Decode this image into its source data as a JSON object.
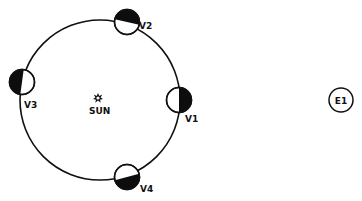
{
  "diagram": {
    "colors": {
      "line": "#111111",
      "dark": "#0d0d0d",
      "background": "#ffffff"
    },
    "orbit": {
      "cx": 100,
      "cy": 100,
      "r": 80
    },
    "sun": {
      "label": "SUN",
      "icon": "sun-icon",
      "x": 98,
      "y": 99
    },
    "planets": [
      {
        "id": "V1",
        "label": "V1",
        "x": 179,
        "y": 100,
        "dark_side": "right"
      },
      {
        "id": "V2",
        "label": "V2",
        "x": 127,
        "y": 22,
        "dark_side": "top"
      },
      {
        "id": "V3",
        "label": "V3",
        "x": 22,
        "y": 82,
        "dark_side": "left"
      },
      {
        "id": "V4",
        "label": "V4",
        "x": 127,
        "y": 177,
        "dark_side": "bottom"
      }
    ],
    "earth": {
      "label": "E1",
      "x": 341,
      "y": 100
    }
  }
}
